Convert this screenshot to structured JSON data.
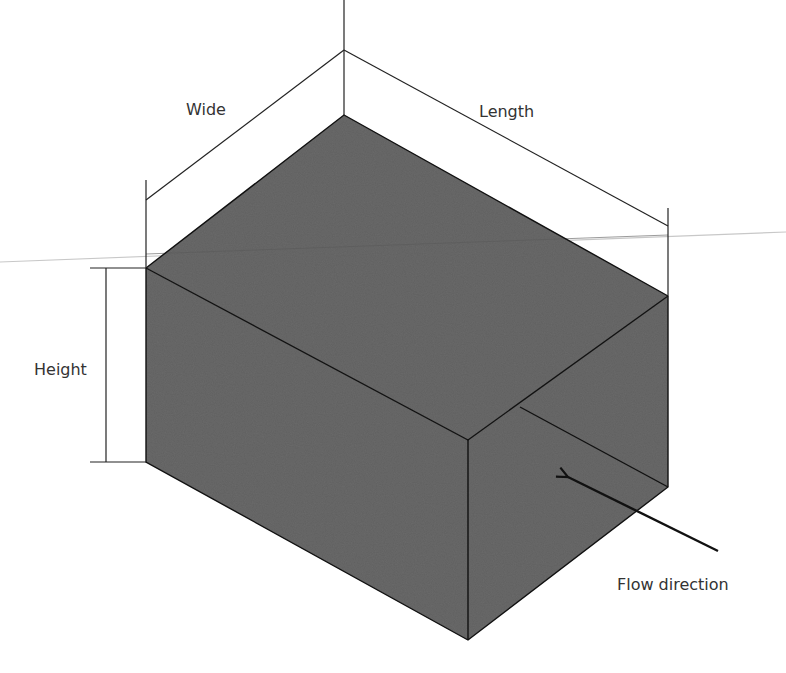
{
  "diagram": {
    "type": "isometric-box-with-dimensions",
    "colors": {
      "face": "#6b6b6b",
      "edge": "#111111",
      "dimension_line": "#222222",
      "guide_line": "#c8c8c8",
      "label": "#333333",
      "background": "#ffffff"
    },
    "labels": {
      "wide": "Wide",
      "length": "Length",
      "height": "Height",
      "flow": "Flow direction"
    },
    "vertices": {
      "top_back": [
        344,
        115
      ],
      "top_left": [
        146,
        268
      ],
      "top_right": [
        668,
        296
      ],
      "top_front": [
        468,
        440
      ],
      "bottom_front": [
        468,
        640
      ],
      "bottom_left": [
        146,
        462
      ],
      "bottom_right": [
        668,
        487
      ]
    }
  }
}
